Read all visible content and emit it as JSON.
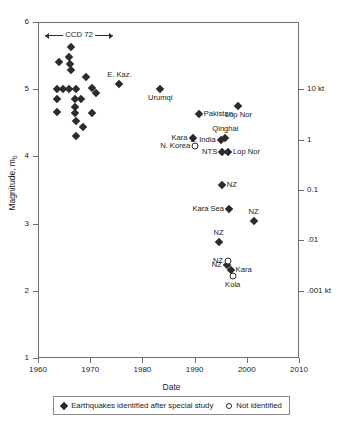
{
  "chart_data": {
    "type": "scatter",
    "title": "",
    "xlabel": "Date",
    "ylabel": "Magnitude, m_b",
    "xlim": [
      1960,
      2010
    ],
    "ylim": [
      1,
      6
    ],
    "grid": false,
    "legend_position": "below-axis",
    "xticks": [
      1960,
      1970,
      1980,
      1990,
      2000,
      2010
    ],
    "xtick_labels": [
      "1960",
      "1970",
      "1980",
      "1990",
      "2000",
      "2010"
    ],
    "yticks": [
      1,
      2,
      3,
      4,
      5,
      6
    ],
    "ytick_labels": [
      "1",
      "2",
      "3",
      "4",
      "5",
      "6"
    ],
    "secondary_axis": {
      "label": "",
      "ticks": [
        {
          "value": 5.0,
          "label": "10 kt"
        },
        {
          "value": 4.25,
          "label": "1"
        },
        {
          "value": 3.5,
          "label": "0.1"
        },
        {
          "value": 2.75,
          "label": ".01"
        },
        {
          "value": 2.0,
          "label": ".001 kt"
        }
      ]
    },
    "annotations": [
      {
        "name": "ccd-72",
        "text": "CCD 72",
        "x_start": 1961.4,
        "x_end": 1974.4,
        "y": 5.8,
        "style": "double-arrow"
      }
    ],
    "legend": [
      {
        "marker": "filled-diamond",
        "label": "Earthquakes identified after special study"
      },
      {
        "marker": "open-circle",
        "label": "Not identified"
      }
    ],
    "series": [
      {
        "name": "Earthquakes identified after special study",
        "marker": "filled-diamond",
        "points": [
          {
            "x": 1964.0,
            "y": 5.4,
            "label": ""
          },
          {
            "x": 1966.4,
            "y": 5.63,
            "label": ""
          },
          {
            "x": 1966.0,
            "y": 5.48,
            "label": ""
          },
          {
            "x": 1966.2,
            "y": 5.38,
            "label": ""
          },
          {
            "x": 1966.3,
            "y": 5.28,
            "label": ""
          },
          {
            "x": 1969.2,
            "y": 5.18,
            "label": ""
          },
          {
            "x": 1963.6,
            "y": 5.0,
            "label": ""
          },
          {
            "x": 1964.8,
            "y": 5.0,
            "label": ""
          },
          {
            "x": 1966.0,
            "y": 5.0,
            "label": ""
          },
          {
            "x": 1967.2,
            "y": 5.0,
            "label": ""
          },
          {
            "x": 1970.4,
            "y": 5.02,
            "label": ""
          },
          {
            "x": 1971.2,
            "y": 4.94,
            "label": ""
          },
          {
            "x": 1963.7,
            "y": 4.86,
            "label": ""
          },
          {
            "x": 1967.0,
            "y": 4.86,
            "label": ""
          },
          {
            "x": 1968.2,
            "y": 4.86,
            "label": ""
          },
          {
            "x": 1967.1,
            "y": 4.74,
            "label": ""
          },
          {
            "x": 1963.6,
            "y": 4.66,
            "label": ""
          },
          {
            "x": 1967.1,
            "y": 4.64,
            "label": ""
          },
          {
            "x": 1970.3,
            "y": 4.64,
            "label": ""
          },
          {
            "x": 1967.2,
            "y": 4.52,
            "label": ""
          },
          {
            "x": 1968.6,
            "y": 4.44,
            "label": ""
          },
          {
            "x": 1967.3,
            "y": 4.3,
            "label": ""
          },
          {
            "x": 1975.6,
            "y": 5.08,
            "label": "E. Kaz.",
            "label_pos": "above"
          },
          {
            "x": 1983.4,
            "y": 5.0,
            "label": "Urumqi",
            "label_pos": "below"
          },
          {
            "x": 1998.4,
            "y": 4.75,
            "label": "Lop Nor",
            "label_pos": "below"
          },
          {
            "x": 1990.8,
            "y": 4.63,
            "label": "Pakistan",
            "label_pos": "right"
          },
          {
            "x": 1989.6,
            "y": 4.28,
            "label": "Kara",
            "label_pos": "left"
          },
          {
            "x": 1995.0,
            "y": 4.25,
            "label": "S. India",
            "label_pos": "left"
          },
          {
            "x": 1995.9,
            "y": 4.27,
            "label": "Qinghai",
            "label_pos": "above"
          },
          {
            "x": 1995.3,
            "y": 4.06,
            "label": "NTS",
            "label_pos": "left"
          },
          {
            "x": 1996.4,
            "y": 4.06,
            "label": "Lop Nor",
            "label_pos": "right"
          },
          {
            "x": 1995.2,
            "y": 3.57,
            "label": "NZ",
            "label_pos": "right"
          },
          {
            "x": 1996.6,
            "y": 3.22,
            "label": "Kara Sea",
            "label_pos": "left"
          },
          {
            "x": 2001.3,
            "y": 3.04,
            "label": "NZ",
            "label_pos": "above"
          },
          {
            "x": 1994.6,
            "y": 2.73,
            "label": "NZ",
            "label_pos": "above"
          },
          {
            "x": 1996.2,
            "y": 2.38,
            "label": "NZ",
            "label_pos": "left"
          },
          {
            "x": 1996.9,
            "y": 2.31,
            "label": "Kara",
            "label_pos": "right"
          }
        ]
      },
      {
        "name": "Not identified",
        "marker": "open-circle",
        "points": [
          {
            "x": 1990.1,
            "y": 4.16,
            "label": "N. Korea",
            "label_pos": "left"
          },
          {
            "x": 1996.4,
            "y": 2.45,
            "label": "NZ",
            "label_pos": "left"
          },
          {
            "x": 1997.3,
            "y": 2.22,
            "label": "Kola",
            "label_pos": "below"
          }
        ]
      }
    ]
  }
}
